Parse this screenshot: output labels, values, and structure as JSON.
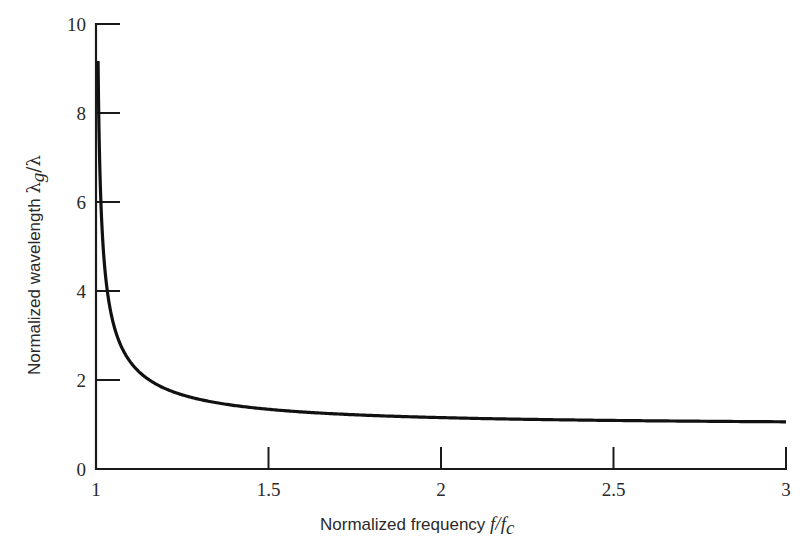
{
  "chart_data": {
    "type": "line",
    "title": "",
    "xlabel": "Normalized frequency f/f_c",
    "xlabel_parts": {
      "text": "Normalized frequency ",
      "var": "f",
      "slash": "/",
      "var2": "f",
      "sub": "c"
    },
    "ylabel": "Normalized wavelength λ_g/λ",
    "ylabel_parts": {
      "text": "Normalized wavelength ",
      "lambda": "λ",
      "sub": "g",
      "slash": "/",
      "lambda2": "λ"
    },
    "xlim": [
      1,
      3
    ],
    "ylim": [
      0,
      10
    ],
    "x_ticks": [
      1,
      1.5,
      2,
      2.5,
      3
    ],
    "x_tick_labels": [
      "1",
      "1.5",
      "2",
      "2.5",
      "3"
    ],
    "y_ticks": [
      0,
      2,
      4,
      6,
      8,
      10
    ],
    "y_tick_labels": [
      "0",
      "2",
      "4",
      "6",
      "8",
      "10"
    ],
    "grid": false,
    "legend": null,
    "series": [
      {
        "name": "λg/λ = 1/sqrt(1 - (fc/f)^2)",
        "x": [
          1.006,
          1.01,
          1.02,
          1.05,
          1.1,
          1.2,
          1.3,
          1.5,
          1.75,
          2.0,
          2.5,
          3.0
        ],
        "y": [
          9.16,
          7.12,
          5.07,
          3.28,
          2.4,
          1.81,
          1.56,
          1.34,
          1.22,
          1.15,
          1.09,
          1.06
        ],
        "color": "#111111"
      }
    ]
  },
  "colors": {
    "axis": "#1a1a1a",
    "curve": "#111111",
    "background": "#ffffff"
  }
}
